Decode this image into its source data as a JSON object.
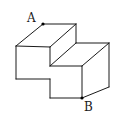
{
  "diagram": {
    "type": "isometric-solid",
    "points": [
      {
        "id": "A",
        "label": "A",
        "x": 43,
        "y": 24,
        "label_x": 27,
        "label_y": 22
      },
      {
        "id": "B",
        "label": "B",
        "x": 82,
        "y": 98,
        "label_x": 84,
        "label_y": 111
      }
    ],
    "edges": [
      [
        43,
        24,
        76,
        24
      ],
      [
        43,
        24,
        16,
        46
      ],
      [
        76,
        24,
        50,
        47
      ],
      [
        16,
        46,
        50,
        47
      ],
      [
        16,
        46,
        16,
        79
      ],
      [
        16,
        79,
        50,
        79
      ],
      [
        50,
        79,
        50,
        98
      ],
      [
        50,
        98,
        82,
        98
      ],
      [
        82,
        98,
        82,
        66
      ],
      [
        50,
        66,
        82,
        66
      ],
      [
        50,
        47,
        50,
        66
      ],
      [
        76,
        24,
        76,
        43
      ],
      [
        76,
        43,
        109,
        43
      ],
      [
        109,
        43,
        82,
        66
      ],
      [
        109,
        43,
        109,
        87
      ],
      [
        109,
        87,
        82,
        98
      ],
      [
        50,
        66,
        76,
        43
      ]
    ],
    "colors": {
      "stroke": "#1a1a1a",
      "background": "#ffffff"
    }
  }
}
